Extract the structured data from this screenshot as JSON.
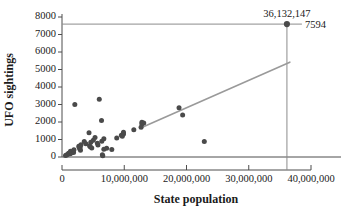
{
  "chart_data": {
    "type": "scatter",
    "title": "",
    "xlabel": "State population",
    "ylabel": "UFO sightings",
    "xlim": [
      -1500000,
      42000000
    ],
    "ylim": [
      -400,
      8300
    ],
    "grid": false,
    "legend": null,
    "x_ticks": [
      0,
      10000000,
      20000000,
      30000000,
      40000000
    ],
    "x_tick_labels": [
      "0",
      "10,000,000",
      "20,000,000",
      "30,000,000",
      "40,000,000"
    ],
    "y_ticks": [
      0,
      1000,
      2000,
      3000,
      4000,
      5000,
      6000,
      7000,
      8000
    ],
    "y_tick_labels": [
      "0",
      "1000",
      "2000",
      "3000",
      "4000",
      "5000",
      "6000",
      "7000",
      "8000"
    ],
    "points": [
      [
        563626,
        90
      ],
      [
        710231,
        120
      ],
      [
        897934,
        150
      ],
      [
        1052567,
        210
      ],
      [
        1316456,
        180
      ],
      [
        1328361,
        230
      ],
      [
        1360301,
        330
      ],
      [
        1567582,
        250
      ],
      [
        1826341,
        300
      ],
      [
        1852994,
        260
      ],
      [
        1912884,
        420
      ],
      [
        2059179,
        3000
      ],
      [
        2700551,
        620
      ],
      [
        2763885,
        540
      ],
      [
        2853118,
        470
      ],
      [
        2915918,
        560
      ],
      [
        2967297,
        390
      ],
      [
        3046355,
        700
      ],
      [
        3574097,
        880
      ],
      [
        3831074,
        760
      ],
      [
        4339367,
        1380
      ],
      [
        4429940,
        640
      ],
      [
        4533372,
        590
      ],
      [
        4625364,
        850
      ],
      [
        4779736,
        520
      ],
      [
        5029196,
        960
      ],
      [
        5303925,
        1120
      ],
      [
        5686986,
        780
      ],
      [
        5773552,
        680
      ],
      [
        5988927,
        3300
      ],
      [
        6346105,
        2080
      ],
      [
        6392017,
        900
      ],
      [
        6483802,
        130
      ],
      [
        6547629,
        70
      ],
      [
        6724540,
        450
      ],
      [
        6724540,
        1040
      ],
      [
        7170351,
        500
      ],
      [
        8001024,
        430
      ],
      [
        8791894,
        1080
      ],
      [
        9535483,
        1250
      ],
      [
        9687653,
        1180
      ],
      [
        9883360,
        1320
      ],
      [
        9877670,
        1420
      ],
      [
        11536504,
        1560
      ],
      [
        12702379,
        1700
      ],
      [
        12830632,
        1980
      ],
      [
        12830632,
        1880
      ],
      [
        13131892,
        1940
      ],
      [
        18801310,
        2820
      ],
      [
        19378102,
        2400
      ],
      [
        22859968,
        880
      ]
    ],
    "highlight_point": {
      "x": 36132147,
      "y": 7594,
      "x_label": "36,132,147",
      "y_label": "7594"
    },
    "trend_line": {
      "x_start": 12900000,
      "y_start": 1700,
      "x_end": 36600000,
      "y_end": 5420
    },
    "colors": {
      "point": "#4a4a4a",
      "trend": "#9a9a9a",
      "reference": "#8c8c8c",
      "axis": "#4d4d4d",
      "text": "#1a1a1a",
      "background": "#ffffff"
    }
  }
}
